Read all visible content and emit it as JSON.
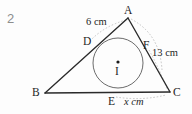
{
  "question": {
    "number": "2"
  },
  "figure": {
    "type": "geometry-incircle-triangle",
    "vertices": [
      {
        "name": "A",
        "label": "A",
        "x": 128,
        "y": 18
      },
      {
        "name": "B",
        "label": "B",
        "x": 45,
        "y": 93
      },
      {
        "name": "C",
        "label": "C",
        "x": 170,
        "y": 92
      }
    ],
    "tangent_points": [
      {
        "name": "D",
        "label": "D",
        "x": 92,
        "y": 43,
        "on": "AB"
      },
      {
        "name": "E",
        "label": "E",
        "x": 113,
        "y": 93,
        "on": "BC"
      },
      {
        "name": "F",
        "label": "F",
        "x": 148,
        "y": 47,
        "on": "CA"
      }
    ],
    "incircle": {
      "center_label": "I",
      "cx": 118,
      "cy": 63,
      "r": 25
    },
    "measurements": [
      {
        "name": "AD",
        "label": "6 cm",
        "segment": "A-D"
      },
      {
        "name": "FC",
        "label": "13 cm",
        "segment": "F-C"
      },
      {
        "name": "EC",
        "label": "x cm",
        "value": "x",
        "unit": "cm",
        "segment": "E-C"
      }
    ],
    "colors": {
      "stroke": "#2a2a2a",
      "circle": "#555555",
      "arc": "#b9b9b9",
      "text": "#1f1f1f",
      "qnum": "#8d8d8d",
      "background": "#fdfdfd"
    }
  }
}
